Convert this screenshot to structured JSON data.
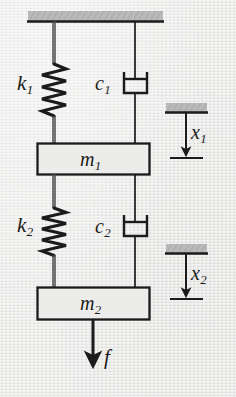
{
  "figure": {
    "kind": "engineering-schematic",
    "background_color": "#e9e9e7",
    "ink_color": "#1b1b1b",
    "hatch_fill_color": "#b9b9b9",
    "block_fill_color": "#ececeb"
  },
  "labels": {
    "spring_1": {
      "symbol": "k",
      "subscript": "1"
    },
    "damper_1": {
      "symbol": "c",
      "subscript": "1"
    },
    "mass_1": {
      "symbol": "m",
      "subscript": "1"
    },
    "spring_2": {
      "symbol": "k",
      "subscript": "2"
    },
    "damper_2": {
      "symbol": "c",
      "subscript": "2"
    },
    "mass_2": {
      "symbol": "m",
      "subscript": "2"
    },
    "displacement_1": {
      "symbol": "x",
      "subscript": "1"
    },
    "displacement_2": {
      "symbol": "x",
      "subscript": "2"
    },
    "force": {
      "symbol": "f",
      "subscript": ""
    }
  },
  "components": {
    "ceiling": {
      "name": "fixed-support",
      "hatched": true
    },
    "spring_1": {
      "name": "spring-k1",
      "coils": 7
    },
    "damper_1": {
      "name": "dashpot-c1"
    },
    "mass_1": {
      "name": "mass-block-m1"
    },
    "spring_2": {
      "name": "spring-k2",
      "coils": 7
    },
    "damper_2": {
      "name": "dashpot-c2"
    },
    "mass_2": {
      "name": "mass-block-m2"
    },
    "force_arrow": {
      "name": "applied-force-arrow",
      "direction": "down"
    },
    "displacement_marker_1": {
      "name": "displacement-marker-x1",
      "direction": "down"
    },
    "displacement_marker_2": {
      "name": "displacement-marker-x2",
      "direction": "down"
    }
  }
}
